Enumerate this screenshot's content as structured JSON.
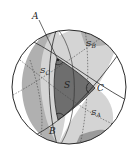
{
  "figure": {
    "vertices": {
      "A": {
        "label": "A"
      },
      "B": {
        "label": "B"
      },
      "C": {
        "label": "C"
      }
    },
    "regions": {
      "S": {
        "label": "S"
      },
      "S_A": {
        "main": "S",
        "sub": "A"
      },
      "S_B": {
        "main": "S",
        "sub": "B"
      },
      "S_C": {
        "main": "S",
        "sub": "C"
      }
    },
    "colors": {
      "outline": "#2a2a2a",
      "triangle": "#6e6e6e",
      "lune_light": "#d4d4d4",
      "lune_mid": "#b0b0b0",
      "lune_dark": "#9a9a9a",
      "background": "#ffffff"
    }
  }
}
